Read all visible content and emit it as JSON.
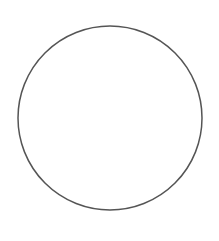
{
  "canvas": {
    "width": 219,
    "height": 241,
    "background": "#ffffff"
  },
  "shapes": [
    {
      "type": "circle",
      "cx": 110,
      "cy": 118,
      "r": 92,
      "fill": "none",
      "stroke": "#555555",
      "stroke_width": 1.5
    }
  ]
}
